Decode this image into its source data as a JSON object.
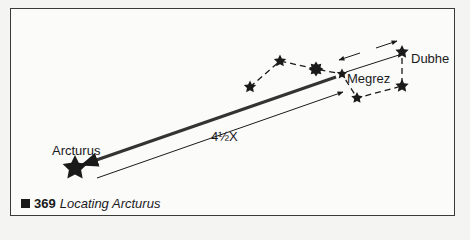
{
  "figure": {
    "labels": {
      "arcturus": "Arcturus",
      "megrez": "Megrez",
      "dubhe": "Dubhe",
      "distance": "4½X"
    },
    "caption": {
      "number": "369",
      "title": "Locating Arcturus"
    },
    "colors": {
      "ink": "#1a1a1a",
      "border": "#3a3a3a",
      "background": "#fbfbfa"
    }
  }
}
